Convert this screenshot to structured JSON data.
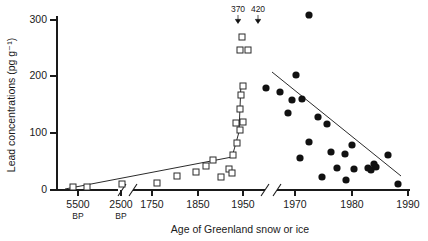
{
  "chart_data": {
    "type": "scatter",
    "title": "",
    "xlabel": "Age of Greenland snow or ice",
    "ylabel": "Lead concentrations (pg g⁻¹)",
    "ylim": [
      0,
      330
    ],
    "yticks": [
      0,
      100,
      200,
      300
    ],
    "ytick_labels": [
      "0",
      "100",
      "200",
      "300"
    ],
    "grid": false,
    "legend": "none",
    "axis_breaks": 2,
    "x_segments": [
      {
        "name": "ancient-bp",
        "ticks": [
          5500,
          2500
        ],
        "tick_labels": [
          "5500",
          "2500"
        ],
        "tick_sublabels": [
          "BP",
          "BP"
        ]
      },
      {
        "name": "historic-years",
        "ticks": [
          1750,
          1850,
          1950
        ],
        "tick_labels": [
          "1750",
          "1850",
          "1950"
        ],
        "tick_sublabels": [
          "",
          "",
          ""
        ]
      },
      {
        "name": "modern-years",
        "ticks": [
          1970,
          1980,
          1990
        ],
        "tick_labels": [
          "1970",
          "1980",
          "1990"
        ],
        "tick_sublabels": [
          "",
          "",
          ""
        ]
      }
    ],
    "annotations": [
      {
        "text": "370",
        "x_px": 238,
        "y_px": 12,
        "arrow": true
      },
      {
        "text": "420",
        "x_px": 258,
        "y_px": 12,
        "arrow": true
      }
    ],
    "series": [
      {
        "name": "Ancient and historic snow/ice (open squares)",
        "marker": "open-square",
        "points_px": [
          [
            73,
            187
          ],
          [
            87,
            187
          ],
          [
            122,
            184
          ],
          [
            157,
            183
          ],
          [
            177,
            176
          ],
          [
            196,
            172
          ],
          [
            206,
            166
          ],
          [
            213,
            160
          ],
          [
            221,
            177
          ],
          [
            229,
            169
          ],
          [
            233,
            155
          ],
          [
            237,
            143
          ],
          [
            240,
            130
          ],
          [
            236,
            123
          ],
          [
            243,
            122
          ],
          [
            240,
            109
          ],
          [
            241,
            95
          ],
          [
            243,
            86
          ],
          [
            240,
            50
          ],
          [
            248,
            50
          ],
          [
            242,
            37
          ],
          [
            232,
            173
          ]
        ]
      },
      {
        "name": "Modern snow/ice (filled circles)",
        "marker": "filled-circle",
        "points_px": [
          [
            309,
            15
          ],
          [
            266,
            88
          ],
          [
            280,
            92
          ],
          [
            296,
            75
          ],
          [
            292,
            100
          ],
          [
            302,
            99
          ],
          [
            288,
            113
          ],
          [
            318,
            117
          ],
          [
            327,
            124
          ],
          [
            309,
            142
          ],
          [
            352,
            145
          ],
          [
            331,
            152
          ],
          [
            345,
            154
          ],
          [
            300,
            158
          ],
          [
            337,
            168
          ],
          [
            354,
            169
          ],
          [
            368,
            168
          ],
          [
            371,
            170
          ],
          [
            374,
            164
          ],
          [
            376,
            167
          ],
          [
            322,
            177
          ],
          [
            346,
            180
          ],
          [
            388,
            155
          ],
          [
            398,
            184
          ]
        ]
      }
    ],
    "trend_lines": [
      {
        "name": "historic-rise",
        "segments": [
          [
            65,
            189
          ],
          [
            232,
            157
          ],
          [
            239,
            132
          ],
          [
            241,
            83
          ]
        ]
      },
      {
        "name": "modern-decline-regression",
        "segments": [
          [
            272,
            72
          ],
          [
            401,
            176
          ]
        ]
      }
    ]
  }
}
